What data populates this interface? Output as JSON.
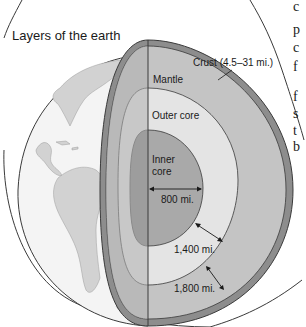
{
  "title": "Layers of the earth",
  "labels": {
    "crust": "Crust (4.5–31 mi.)",
    "mantle": "Mantle",
    "outer_core": "Outer core",
    "inner_core_line1": "Inner",
    "inner_core_line2": "core",
    "inner_radius": "800 mi.",
    "outer_core_thickness": "1,400 mi.",
    "mantle_thickness": "1,800 mi."
  },
  "side_text_fragments": [
    "c",
    "p",
    "c",
    "f",
    "f",
    "s",
    "t",
    "b"
  ],
  "colors": {
    "crust": "#8d8d8d",
    "mantle": "#c4c4c4",
    "outer_core": "#e4e4e4",
    "inner_core": "#a9a9a9",
    "inner_core_shadow": "#9a9a9a",
    "ocean": "#f4f4f4",
    "land": "#d2d2d2",
    "outline": "#3a3a3a"
  }
}
